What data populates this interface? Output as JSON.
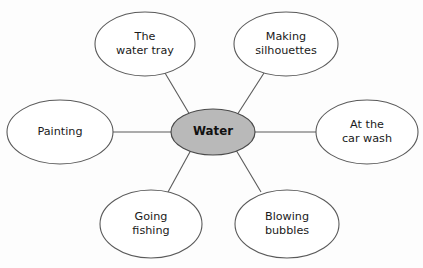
{
  "diagram": {
    "type": "spider-web-mind-map",
    "center": {
      "label": "Water",
      "fill": "#b9b9b9",
      "stroke": "#4a4a4a",
      "cx": 213,
      "cy": 132,
      "rx": 42,
      "ry": 23
    },
    "style": {
      "background": "#fdfdfd",
      "node_fill": "#ffffff",
      "node_stroke": "#5a5a5a",
      "connector_stroke": "#5a5a5a",
      "text_color": "#1a1a1a"
    },
    "nodes": [
      {
        "id": "water-tray",
        "label": "The\nwater tray",
        "cx": 145,
        "cy": 44,
        "rx": 50,
        "ry": 32,
        "connector": {
          "x1": 190,
          "y1": 115,
          "x2": 165,
          "y2": 73
        }
      },
      {
        "id": "making-silhouettes",
        "label": "Making\nsilhouettes",
        "cx": 286,
        "cy": 44,
        "rx": 52,
        "ry": 32,
        "connector": {
          "x1": 237,
          "y1": 115,
          "x2": 264,
          "y2": 73
        }
      },
      {
        "id": "painting",
        "label": "Painting",
        "cx": 60,
        "cy": 132,
        "rx": 53,
        "ry": 32,
        "connector": {
          "x1": 171,
          "y1": 132,
          "x2": 113,
          "y2": 132
        }
      },
      {
        "id": "at-the-car-wash",
        "label": "At the\ncar wash",
        "cx": 367,
        "cy": 132,
        "rx": 51,
        "ry": 32,
        "connector": {
          "x1": 255,
          "y1": 132,
          "x2": 316,
          "y2": 132
        }
      },
      {
        "id": "going-fishing",
        "label": "Going\nfishing",
        "cx": 151,
        "cy": 224,
        "rx": 51,
        "ry": 34,
        "connector": {
          "x1": 191,
          "y1": 150,
          "x2": 168,
          "y2": 192
        }
      },
      {
        "id": "blowing-bubbles",
        "label": "Blowing\nbubbles",
        "cx": 287,
        "cy": 224,
        "rx": 52,
        "ry": 34,
        "connector": {
          "x1": 236,
          "y1": 150,
          "x2": 261,
          "y2": 192
        }
      }
    ]
  }
}
